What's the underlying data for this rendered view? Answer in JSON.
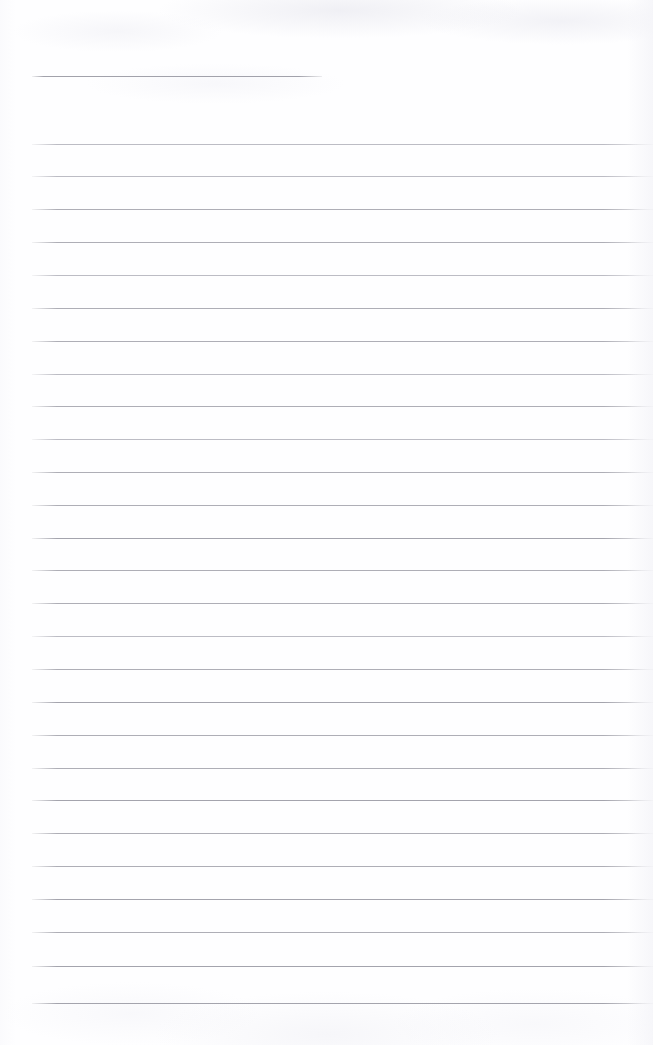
{
  "document": {
    "kind": "scanned-lined-page",
    "title": "",
    "body_text": "",
    "page_number": "",
    "header_text": "",
    "footer_text": "",
    "note": ""
  },
  "colors": {
    "page_background": "#fefeff",
    "rule_line": "#aeaeb6",
    "rule_line_faint": "#bcbcc4",
    "rule_line_strong": "#a4a4ad",
    "header_rule": "#a2a2ab"
  },
  "layout": {
    "width": 653,
    "height": 1045,
    "rule_left_x": 32,
    "rule_right_x": 649,
    "header_rule_right_x": 322,
    "line_spacing": 32.8
  },
  "rules": [
    {
      "name": "header-rule",
      "y": 76,
      "x": 32,
      "width": 290,
      "weight": "header-rule"
    },
    {
      "name": "rule-1",
      "y": 144,
      "x": 32,
      "width": 621,
      "weight": "faint"
    },
    {
      "name": "rule-2",
      "y": 176,
      "x": 32,
      "width": 621,
      "weight": "faint"
    },
    {
      "name": "rule-3",
      "y": 209,
      "x": 32,
      "width": 621,
      "weight": ""
    },
    {
      "name": "rule-4",
      "y": 242,
      "x": 32,
      "width": 621,
      "weight": ""
    },
    {
      "name": "rule-5",
      "y": 275,
      "x": 32,
      "width": 621,
      "weight": "faint"
    },
    {
      "name": "rule-6",
      "y": 308,
      "x": 32,
      "width": 621,
      "weight": ""
    },
    {
      "name": "rule-7",
      "y": 341,
      "x": 32,
      "width": 621,
      "weight": ""
    },
    {
      "name": "rule-8",
      "y": 374,
      "x": 32,
      "width": 621,
      "weight": "faint"
    },
    {
      "name": "rule-9",
      "y": 406,
      "x": 32,
      "width": 621,
      "weight": ""
    },
    {
      "name": "rule-10",
      "y": 439,
      "x": 32,
      "width": 621,
      "weight": "faint"
    },
    {
      "name": "rule-11",
      "y": 472,
      "x": 32,
      "width": 621,
      "weight": ""
    },
    {
      "name": "rule-12",
      "y": 505,
      "x": 32,
      "width": 621,
      "weight": ""
    },
    {
      "name": "rule-13",
      "y": 538,
      "x": 32,
      "width": 621,
      "weight": "strong"
    },
    {
      "name": "rule-14",
      "y": 570,
      "x": 32,
      "width": 621,
      "weight": ""
    },
    {
      "name": "rule-15",
      "y": 603,
      "x": 32,
      "width": 621,
      "weight": ""
    },
    {
      "name": "rule-16",
      "y": 636,
      "x": 32,
      "width": 621,
      "weight": "faint"
    },
    {
      "name": "rule-17",
      "y": 669,
      "x": 32,
      "width": 621,
      "weight": ""
    },
    {
      "name": "rule-18",
      "y": 702,
      "x": 32,
      "width": 621,
      "weight": "strong"
    },
    {
      "name": "rule-19",
      "y": 735,
      "x": 32,
      "width": 621,
      "weight": ""
    },
    {
      "name": "rule-20",
      "y": 768,
      "x": 32,
      "width": 621,
      "weight": ""
    },
    {
      "name": "rule-21",
      "y": 800,
      "x": 32,
      "width": 621,
      "weight": "strong"
    },
    {
      "name": "rule-22",
      "y": 833,
      "x": 32,
      "width": 621,
      "weight": ""
    },
    {
      "name": "rule-23",
      "y": 866,
      "x": 32,
      "width": 621,
      "weight": ""
    },
    {
      "name": "rule-24",
      "y": 899,
      "x": 32,
      "width": 621,
      "weight": "strong"
    },
    {
      "name": "rule-25",
      "y": 932,
      "x": 32,
      "width": 621,
      "weight": ""
    },
    {
      "name": "rule-26",
      "y": 966,
      "x": 32,
      "width": 621,
      "weight": "strong"
    },
    {
      "name": "rule-27",
      "y": 1003,
      "x": 32,
      "width": 621,
      "weight": "strong"
    }
  ]
}
